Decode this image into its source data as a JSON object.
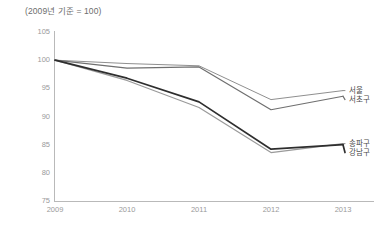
{
  "chart_data": {
    "type": "line",
    "title": "(2009년 기준 = 100)",
    "xlabel": "",
    "ylabel": "",
    "categories": [
      "2009",
      "2010",
      "2011",
      "2012",
      "2013"
    ],
    "x": [
      2009,
      2010,
      2011,
      2012,
      2013
    ],
    "ylim": [
      75,
      105
    ],
    "yticks": [
      105,
      100,
      95,
      90,
      85,
      80,
      75
    ],
    "xticks": [
      "2009",
      "2010",
      "2011",
      "2012",
      "2013"
    ],
    "grid": false,
    "legend_position": "right",
    "series": [
      {
        "name": "서울",
        "color": "#8f8f8f",
        "width": 1.0,
        "values": [
          100,
          99.4,
          99.0,
          93.0,
          94.6
        ]
      },
      {
        "name": "서초구",
        "color": "#6f6f6f",
        "width": 1.2,
        "values": [
          100,
          98.6,
          98.8,
          91.2,
          93.6
        ]
      },
      {
        "name": "송파구",
        "color": "#9a9a9a",
        "width": 1.2,
        "values": [
          100,
          96.4,
          91.6,
          83.6,
          85.2
        ]
      },
      {
        "name": "강남구",
        "color": "#2e2e2e",
        "width": 1.7,
        "values": [
          100,
          96.8,
          92.6,
          84.2,
          85.0
        ]
      }
    ]
  },
  "legend": {
    "items": [
      {
        "label": "서울"
      },
      {
        "label": "서초구"
      },
      {
        "label": "송파구"
      },
      {
        "label": "강남구"
      }
    ]
  },
  "axis": {
    "y_labels": [
      "105",
      "100",
      "95",
      "90",
      "85",
      "80",
      "75"
    ],
    "x_labels": [
      "2009",
      "2010",
      "2011",
      "2012",
      "2013"
    ]
  }
}
